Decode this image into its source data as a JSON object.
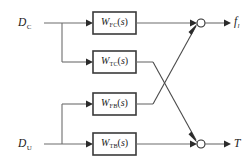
{
  "diagram": {
    "type": "control-system-block-diagram",
    "inputs": [
      {
        "id": "dc",
        "symbol": "D",
        "subscript": "C",
        "display": "D_C"
      },
      {
        "id": "du",
        "symbol": "D",
        "subscript": "U",
        "display": "D_U"
      }
    ],
    "blocks": [
      {
        "id": "block-wfc",
        "symbol": "W",
        "subscript": "FC",
        "arg": "(s)",
        "display": "W_FC(s)"
      },
      {
        "id": "block-wtc",
        "symbol": "W",
        "subscript": "TC",
        "arg": "(s)",
        "display": "W_TC(s)"
      },
      {
        "id": "block-wfb",
        "symbol": "W",
        "subscript": "FB",
        "arg": "(s)",
        "display": "W_FB(s)"
      },
      {
        "id": "block-wtb",
        "symbol": "W",
        "subscript": "TB",
        "arg": "(s)",
        "display": "W_TB(s)"
      }
    ],
    "junctions": [
      {
        "id": "sum-top",
        "shape": "open-circle"
      },
      {
        "id": "sum-bottom",
        "shape": "open-circle"
      }
    ],
    "outputs": [
      {
        "id": "out-f",
        "symbol": "f",
        "subscript": "l",
        "display": "f_l"
      },
      {
        "id": "out-t",
        "symbol": "T",
        "subscript": "",
        "display": "T"
      }
    ],
    "colors": {
      "wire": "#6d6d6d",
      "block_border": "#3a3a3a",
      "text": "#1a1a1a",
      "background": "#ffffff"
    }
  }
}
